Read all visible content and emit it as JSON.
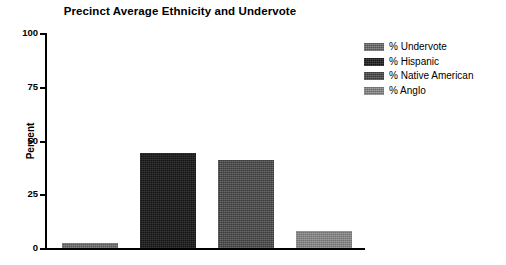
{
  "chart_data": {
    "type": "bar",
    "title": "Precinct Average Ethnicity and Undervote",
    "xlabel": "",
    "ylabel": "Percent",
    "ylim": [
      0,
      100
    ],
    "yticks": [
      0,
      25,
      50,
      75,
      100
    ],
    "ytick_labels": [
      "0",
      "25",
      "50",
      "75",
      "100"
    ],
    "grid": false,
    "legend_position": "right",
    "categories": [
      "% Undervote",
      "% Hispanic",
      "% Native American",
      "% Anglo"
    ],
    "values": [
      2.5,
      44,
      41,
      8
    ],
    "bar_colors": [
      "#6e6e6e",
      "#1c1c1c",
      "#4a4a4a",
      "#8a8a8a"
    ],
    "series": [
      {
        "name": "Precinct Average",
        "points": [
          {
            "category": "% Undervote",
            "value": 2.5,
            "color": "#6e6e6e"
          },
          {
            "category": "% Hispanic",
            "value": 44,
            "color": "#1c1c1c"
          },
          {
            "category": "% Native American",
            "value": 41,
            "color": "#4a4a4a"
          },
          {
            "category": "% Anglo",
            "value": 8,
            "color": "#8a8a8a"
          }
        ]
      }
    ],
    "legend": [
      {
        "label": "% Undervote",
        "color": "#6e6e6e"
      },
      {
        "label": "% Hispanic",
        "color": "#1c1c1c"
      },
      {
        "label": "% Native American",
        "color": "#4a4a4a"
      },
      {
        "label": "% Anglo",
        "color": "#8a8a8a"
      }
    ]
  }
}
